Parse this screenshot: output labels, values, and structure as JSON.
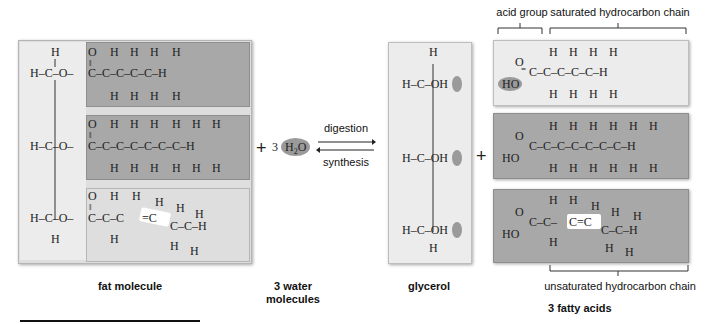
{
  "fat_molecule": {
    "label": "fat molecule",
    "glycerol_backbone": [
      "H",
      "H-C-O",
      "H-C-O",
      "H-C-O",
      "H"
    ],
    "chains": [
      {
        "type": "saturated",
        "carbons": 5,
        "formula": "O=C-(CH2)3-CH3"
      },
      {
        "type": "saturated",
        "carbons": 7,
        "formula": "O=C-(CH2)5-CH3"
      },
      {
        "type": "unsaturated",
        "carbons": 6,
        "formula": "O=C-CH2-CH=CH-CH2-CH3"
      }
    ]
  },
  "water": {
    "plus": "+",
    "coefficient": "3",
    "formula_h": "H",
    "formula_sub": "2",
    "formula_o": "O",
    "label_line1": "3 water",
    "label_line2": "molecules"
  },
  "reaction": {
    "forward_label": "digestion",
    "reverse_label": "synthesis"
  },
  "glycerol": {
    "label": "glycerol",
    "groups": [
      "H-C-OH",
      "H-C-OH",
      "H-C-OH"
    ]
  },
  "plus2": "+",
  "fatty_acids": {
    "label": "3 fatty acids",
    "top_bracket_acid": "acid group",
    "top_bracket_chain": "saturated hydrocarbon chain",
    "bottom_bracket_chain": "unsaturated hydrocarbon chain",
    "acids": [
      {
        "type": "saturated",
        "carbons": 5
      },
      {
        "type": "saturated",
        "carbons": 7
      },
      {
        "type": "unsaturated",
        "carbons": 6
      }
    ]
  },
  "colors": {
    "dark_panel": "#a8a8a8",
    "light_panel": "#ececec",
    "highlight_oval": "#9a9a9a",
    "double_bond_highlight": "#ffffff"
  }
}
